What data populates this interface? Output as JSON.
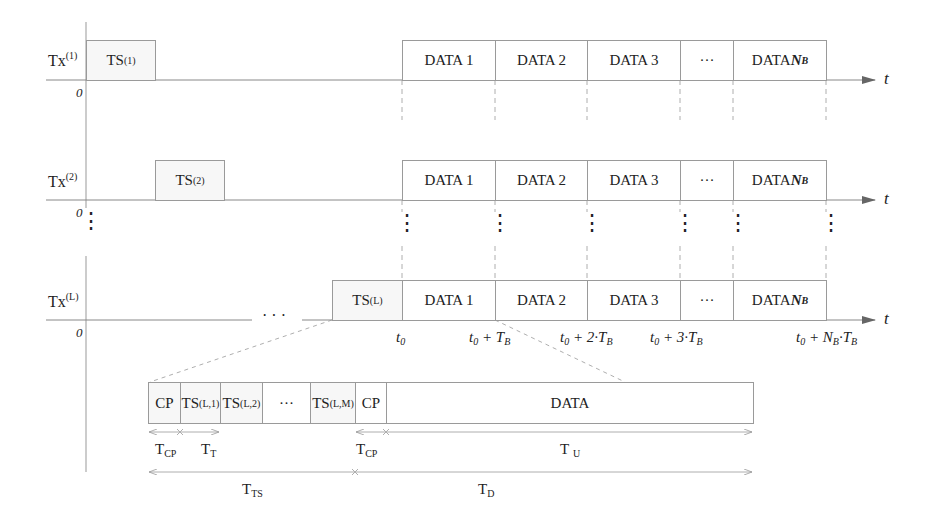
{
  "rows": [
    {
      "tx_label": "Tx",
      "tx_sup": "(1)",
      "ts_label": "TS",
      "ts_sup": "(1)",
      "origin": "0"
    },
    {
      "tx_label": "Tx",
      "tx_sup": "(2)",
      "ts_label": "TS",
      "ts_sup": "(2)",
      "origin": "0"
    },
    {
      "tx_label": "Tx",
      "tx_sup": "(L)",
      "ts_label": "TS",
      "ts_sup": "(L)",
      "origin": "0"
    }
  ],
  "data_blocks": [
    "DATA 1",
    "DATA 2",
    "DATA 3",
    "···",
    "DATA "
  ],
  "data_last_symbol": "N",
  "data_last_sub": "B",
  "axis_label": "t",
  "vertical_ellipsis": "⋮",
  "horizontal_ellipsis": "· · ·",
  "time_ticks": [
    {
      "base": "t",
      "base_sub": "0",
      "rest": ""
    },
    {
      "base": "t",
      "base_sub": "0",
      "rest": " + T",
      "rest_sub": "B"
    },
    {
      "base": "t",
      "base_sub": "0",
      "rest": " + 2·T",
      "rest_sub": "B"
    },
    {
      "base": "t",
      "base_sub": "0",
      "rest": " + 3·T",
      "rest_sub": "B"
    },
    {
      "base": "t",
      "base_sub": "0",
      "rest": " + N",
      "rest_sub": "B",
      "rest2": "·T",
      "rest2_sub": "B"
    }
  ],
  "detail": {
    "blocks": [
      {
        "label": "CP",
        "sup": ""
      },
      {
        "label": "TS",
        "sup": "(L,1)"
      },
      {
        "label": "TS",
        "sup": "(L,2)"
      },
      {
        "label": "···",
        "sup": ""
      },
      {
        "label": "TS",
        "sup": "(L,M)"
      },
      {
        "label": "CP",
        "sup": ""
      },
      {
        "label": "DATA",
        "sup": ""
      }
    ],
    "durations": [
      {
        "label": "T",
        "sub": "CP"
      },
      {
        "label": "T",
        "sub": "T"
      },
      {
        "label": "T",
        "sub": "CP"
      },
      {
        "label": "T",
        "sub": "U"
      },
      {
        "label": "T",
        "sub": "TS"
      },
      {
        "label": "T",
        "sub": "D"
      }
    ]
  }
}
